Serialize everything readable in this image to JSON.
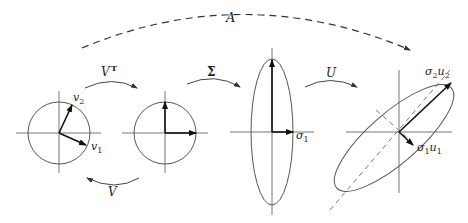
{
  "diagram": {
    "transforms": {
      "A": "A",
      "VT": "V",
      "VT_sup": "T",
      "Sigma": "Σ",
      "U": "U",
      "V": "V"
    },
    "stages": [
      {
        "id": "input-circle",
        "vectors": [
          {
            "label": "v",
            "sub": "1"
          },
          {
            "label": "v",
            "sub": "2"
          }
        ]
      },
      {
        "id": "rotated-circle",
        "vectors": []
      },
      {
        "id": "scaled-ellipse",
        "vectors": [
          {
            "label": "σ",
            "sub": "1"
          }
        ]
      },
      {
        "id": "output-ellipse",
        "vectors": [
          {
            "label": "σ",
            "sub": "2",
            "label2": "u",
            "sub2": "2"
          },
          {
            "label": "σ",
            "sub": "1",
            "label2": "u",
            "sub2": "1"
          }
        ]
      }
    ],
    "colors": {
      "stroke": "#555555",
      "vector": "#111111",
      "background": "#ffffff"
    }
  }
}
